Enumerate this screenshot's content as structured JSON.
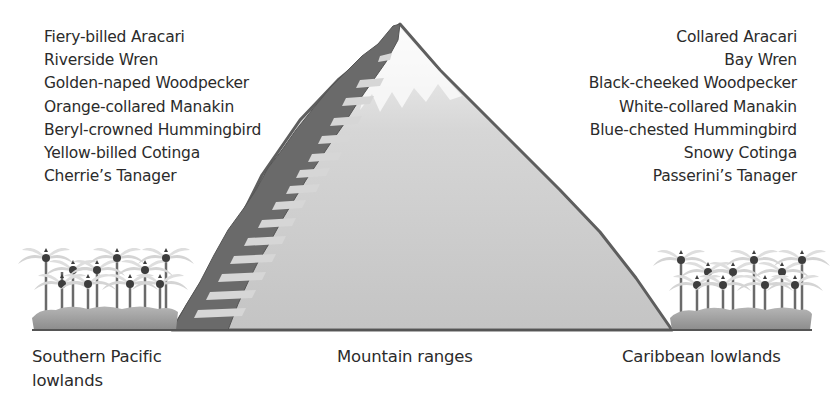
{
  "diagram": {
    "type": "elevation-cross-section",
    "regions": [
      {
        "id": "pacific",
        "label": "Southern Pacific lowlands",
        "label_lines": [
          "Southern Pacific",
          "lowlands"
        ]
      },
      {
        "id": "mountain",
        "label": "Mountain ranges"
      },
      {
        "id": "caribbean",
        "label": "Caribbean lowlands"
      }
    ],
    "pacific_species": [
      "Fiery-billed Aracari",
      "Riverside Wren",
      "Golden-naped Woodpecker",
      "Orange-collared Manakin",
      "Beryl-crowned Hummingbird",
      "Yellow-billed Cotinga",
      "Cherrie’s Tanager"
    ],
    "caribbean_species": [
      "Collared Aracari",
      "Bay Wren",
      "Black-cheeked Woodpecker",
      "White-collared Manakin",
      "Blue-chested Hummingbird",
      "Snowy Cotinga",
      "Passerini’s Tanager"
    ],
    "colors": {
      "mountain_fill": "#c9c9c9",
      "mountain_outline": "#5e5e5e",
      "barrier_band": "#6a6a6a",
      "barrier_stripes": "#d4d4d4",
      "snow": "#ececec",
      "vegetation": "#9a9a9a",
      "palm_fronds": "#d2d2d2",
      "ground_line": "#555555",
      "text": "#2b2b2b"
    }
  }
}
